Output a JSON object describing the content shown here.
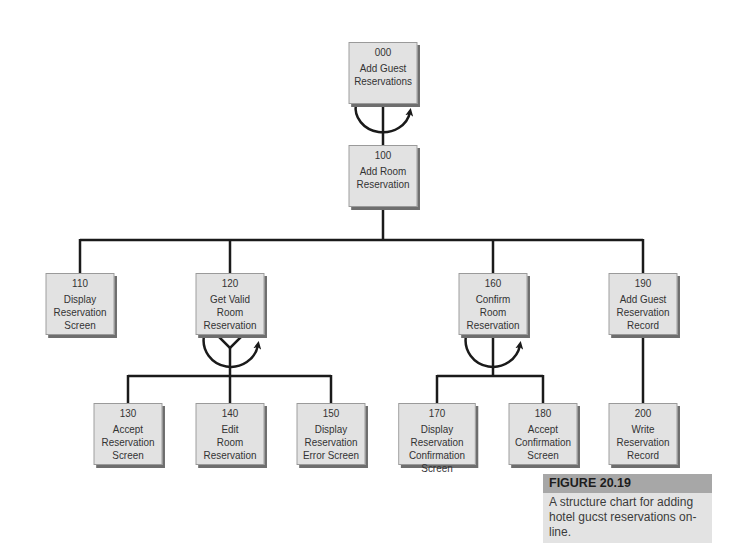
{
  "diagram": {
    "type": "structure-chart",
    "nodes": [
      {
        "id": "000",
        "label": "Add Guest\nReservations"
      },
      {
        "id": "100",
        "label": "Add Room\nReservation"
      },
      {
        "id": "110",
        "label": "Display\nReservation\nScreen"
      },
      {
        "id": "120",
        "label": "Get Valid Room\nReservation"
      },
      {
        "id": "160",
        "label": "Confirm\nRoom\nReservation"
      },
      {
        "id": "190",
        "label": "Add Guest\nReservation\nRecord"
      },
      {
        "id": "130",
        "label": "Accept\nReservation\nScreen"
      },
      {
        "id": "140",
        "label": "Edit\nRoom\nReservation"
      },
      {
        "id": "150",
        "label": "Display\nReservation\nError Screen"
      },
      {
        "id": "170",
        "label": "Display Reservation\nConfirmation\nScreen"
      },
      {
        "id": "180",
        "label": "Accept\nConfirmation\nScreen"
      },
      {
        "id": "200",
        "label": "Write\nReservation\nRecord"
      }
    ],
    "edges": [
      {
        "from": "000",
        "to": "100",
        "loop": true
      },
      {
        "from": "100",
        "to": "110"
      },
      {
        "from": "100",
        "to": "120"
      },
      {
        "from": "100",
        "to": "160"
      },
      {
        "from": "100",
        "to": "190"
      },
      {
        "from": "120",
        "to": "130",
        "loop": true,
        "condition": true
      },
      {
        "from": "120",
        "to": "140",
        "loop": true,
        "condition": true
      },
      {
        "from": "120",
        "to": "150",
        "loop": true,
        "condition": true
      },
      {
        "from": "160",
        "to": "170",
        "loop": true
      },
      {
        "from": "160",
        "to": "180",
        "loop": true
      },
      {
        "from": "190",
        "to": "200"
      }
    ],
    "colors": {
      "box_fill": "#e2e2e2",
      "box_shadow": "#6e6e6e",
      "line": "#1a1a1a",
      "caption_header": "#a7a7a7",
      "caption_body": "#e3e3e3"
    }
  },
  "caption": {
    "title": "FIGURE 20.19",
    "text": "A structure chart for adding hotel gucst reservations on-line."
  }
}
